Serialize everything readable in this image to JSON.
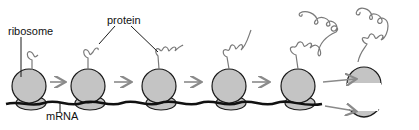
{
  "diagram": {
    "labels": {
      "ribosome": "ribosome",
      "protein": "protein",
      "mrna": "mRNA"
    },
    "colors": {
      "ribosome_fill": "#c4c4c4",
      "outline": "#1a1a1a",
      "arrow": "#8a8a8a",
      "protein_chain": "#7a7a7a",
      "mrna": "#111111"
    },
    "stages": [
      {
        "id": 1,
        "x": 22,
        "state": "initiation, short chain"
      },
      {
        "id": 2,
        "x": 80,
        "state": "elongation"
      },
      {
        "id": 3,
        "x": 150,
        "state": "elongation"
      },
      {
        "id": 4,
        "x": 222,
        "state": "elongation"
      },
      {
        "id": 5,
        "x": 290,
        "state": "long chain"
      },
      {
        "id": 6,
        "x": 350,
        "state": "termination: subunits and protein released"
      }
    ]
  }
}
